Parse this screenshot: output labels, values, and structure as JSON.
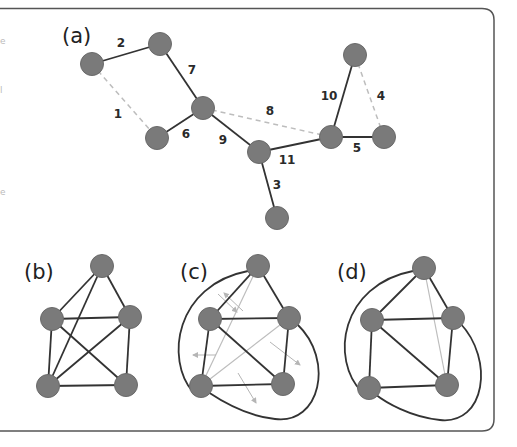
{
  "colors": {
    "node_fill": "#7a7a7a",
    "node_stroke": "#6a6a6a",
    "edge_solid": "#333333",
    "edge_dashed": "#bdbdbd",
    "edge_light": "#bdbdbd",
    "arrow": "#b5b5b5",
    "frame": "#555555"
  },
  "panels": {
    "a": {
      "label": "(a)",
      "nodes": [
        {
          "id": "n1",
          "x": 92,
          "y": 64
        },
        {
          "id": "n2",
          "x": 160,
          "y": 44
        },
        {
          "id": "n3",
          "x": 203,
          "y": 108
        },
        {
          "id": "n4",
          "x": 157,
          "y": 138
        },
        {
          "id": "n5",
          "x": 259,
          "y": 152
        },
        {
          "id": "n6",
          "x": 331,
          "y": 137
        },
        {
          "id": "n7",
          "x": 355,
          "y": 55
        },
        {
          "id": "n8",
          "x": 384,
          "y": 137
        },
        {
          "id": "n9",
          "x": 277,
          "y": 218
        }
      ],
      "edges": [
        {
          "from": "n1",
          "to": "n4",
          "weight": "1",
          "style": "dashed",
          "lx": 118,
          "ly": 118
        },
        {
          "from": "n1",
          "to": "n2",
          "weight": "2",
          "style": "solid",
          "lx": 121,
          "ly": 47
        },
        {
          "from": "n5",
          "to": "n9",
          "weight": "3",
          "style": "solid",
          "lx": 277,
          "ly": 189
        },
        {
          "from": "n7",
          "to": "n8",
          "weight": "4",
          "style": "dashed",
          "lx": 381,
          "ly": 100
        },
        {
          "from": "n6",
          "to": "n8",
          "weight": "5",
          "style": "solid",
          "lx": 357,
          "ly": 152
        },
        {
          "from": "n4",
          "to": "n3",
          "weight": "6",
          "style": "solid",
          "lx": 186,
          "ly": 138
        },
        {
          "from": "n2",
          "to": "n3",
          "weight": "7",
          "style": "solid",
          "lx": 192,
          "ly": 74
        },
        {
          "from": "n3",
          "to": "n6",
          "weight": "8",
          "style": "dashed",
          "lx": 270,
          "ly": 115
        },
        {
          "from": "n3",
          "to": "n5",
          "weight": "9",
          "style": "solid",
          "lx": 223,
          "ly": 144
        },
        {
          "from": "n6",
          "to": "n7",
          "weight": "10",
          "style": "solid",
          "lx": 329,
          "ly": 100
        },
        {
          "from": "n5",
          "to": "n6",
          "weight": "11",
          "style": "solid",
          "lx": 287,
          "ly": 164
        }
      ]
    },
    "b": {
      "label": "(b)",
      "nodes": [
        {
          "id": "t",
          "x": 102,
          "y": 266
        },
        {
          "id": "ml",
          "x": 52,
          "y": 319
        },
        {
          "id": "mr",
          "x": 130,
          "y": 317
        },
        {
          "id": "bl",
          "x": 48,
          "y": 386
        },
        {
          "id": "br",
          "x": 126,
          "y": 385
        }
      ],
      "edges": [
        [
          "t",
          "ml"
        ],
        [
          "t",
          "mr"
        ],
        [
          "t",
          "bl"
        ],
        [
          "ml",
          "mr"
        ],
        [
          "ml",
          "bl"
        ],
        [
          "ml",
          "br"
        ],
        [
          "mr",
          "bl"
        ],
        [
          "mr",
          "br"
        ],
        [
          "bl",
          "br"
        ]
      ]
    },
    "c": {
      "label": "(c)",
      "nodes": [
        {
          "id": "t",
          "x": 258,
          "y": 266
        },
        {
          "id": "ml",
          "x": 210,
          "y": 319
        },
        {
          "id": "mr",
          "x": 289,
          "y": 318
        },
        {
          "id": "bl",
          "x": 201,
          "y": 386
        },
        {
          "id": "br",
          "x": 283,
          "y": 384
        }
      ],
      "edges": [
        [
          "t",
          "ml"
        ],
        [
          "t",
          "mr"
        ],
        [
          "ml",
          "mr"
        ],
        [
          "ml",
          "bl"
        ],
        [
          "ml",
          "br"
        ],
        [
          "mr",
          "br"
        ],
        [
          "bl",
          "br"
        ]
      ],
      "light_edges": [
        [
          "t",
          "bl"
        ],
        [
          "mr",
          "bl"
        ]
      ],
      "curves": [
        "M 248 271 C 175 285, 165 360, 193 392",
        "M 297 324 C 335 360, 320 425, 275 419 C 245 416, 220 400, 208 392"
      ],
      "arrows": [
        {
          "x1": 243,
          "y1": 311,
          "x2": 224,
          "y2": 293
        },
        {
          "x1": 218,
          "y1": 294,
          "x2": 237,
          "y2": 312
        },
        {
          "x1": 216,
          "y1": 355,
          "x2": 193,
          "y2": 355
        },
        {
          "x1": 270,
          "y1": 342,
          "x2": 300,
          "y2": 365
        },
        {
          "x1": 238,
          "y1": 373,
          "x2": 256,
          "y2": 403
        }
      ]
    },
    "d": {
      "label": "(d)",
      "nodes": [
        {
          "id": "t",
          "x": 424,
          "y": 268
        },
        {
          "id": "ml",
          "x": 372,
          "y": 320
        },
        {
          "id": "mr",
          "x": 453,
          "y": 318
        },
        {
          "id": "bl",
          "x": 369,
          "y": 388
        },
        {
          "id": "br",
          "x": 447,
          "y": 385
        }
      ],
      "edges": [
        [
          "t",
          "ml"
        ],
        [
          "t",
          "mr"
        ],
        [
          "ml",
          "mr"
        ],
        [
          "ml",
          "bl"
        ],
        [
          "ml",
          "br"
        ],
        [
          "mr",
          "br"
        ],
        [
          "bl",
          "br"
        ]
      ],
      "light_edges": [
        [
          "t",
          "br"
        ]
      ],
      "curves": [
        "M 413 271 C 340 285, 330 360, 362 392",
        "M 460 323 C 495 360, 485 425, 440 420 C 410 417, 385 402, 375 394"
      ]
    }
  },
  "fragments": [
    {
      "text": "e",
      "x": 0,
      "y": 44
    },
    {
      "text": "l",
      "x": 0,
      "y": 93
    },
    {
      "text": "e",
      "x": 0,
      "y": 195
    }
  ]
}
